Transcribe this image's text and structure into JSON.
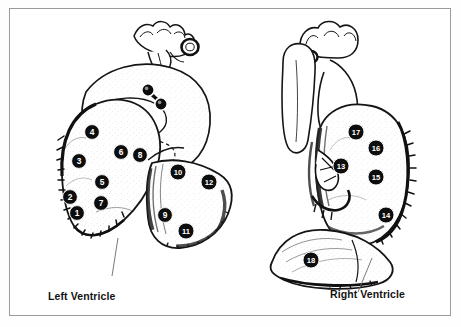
{
  "figure": {
    "border_color": "#9a9a9a",
    "background": "#ffffff",
    "ink_color": "#111111",
    "marker_fill": "#0d0d0d",
    "marker_text_color": "#ffffff"
  },
  "captions": {
    "left": "Left Ventricle",
    "right": "Right Ventricle"
  },
  "panels": [
    {
      "id": "left-ventricle",
      "caption": "Left Ventricle",
      "markers": [
        {
          "label": "1",
          "x": 77,
          "y": 213
        },
        {
          "label": "2",
          "x": 70,
          "y": 197
        },
        {
          "label": "3",
          "x": 79,
          "y": 161
        },
        {
          "label": "4",
          "x": 92,
          "y": 132
        },
        {
          "label": "5",
          "x": 102,
          "y": 182
        },
        {
          "label": "6",
          "x": 121,
          "y": 152
        },
        {
          "label": "7",
          "x": 101,
          "y": 203
        },
        {
          "label": "8",
          "x": 140,
          "y": 155
        },
        {
          "label": "9",
          "x": 165,
          "y": 215
        },
        {
          "label": "10",
          "x": 178,
          "y": 172
        },
        {
          "label": "11",
          "x": 186,
          "y": 231
        },
        {
          "label": "12",
          "x": 209,
          "y": 182
        }
      ],
      "ostia_markers": [
        {
          "name": "ostium-upper",
          "x": 148,
          "y": 90
        },
        {
          "name": "ostium-lower",
          "x": 161,
          "y": 104
        }
      ]
    },
    {
      "id": "right-ventricle",
      "caption": "Right Ventricle",
      "markers": [
        {
          "label": "13",
          "x": 341,
          "y": 166
        },
        {
          "label": "14",
          "x": 386,
          "y": 215
        },
        {
          "label": "15",
          "x": 376,
          "y": 177
        },
        {
          "label": "16",
          "x": 376,
          "y": 148
        },
        {
          "label": "17",
          "x": 356,
          "y": 132
        },
        {
          "label": "18",
          "x": 311,
          "y": 260
        }
      ]
    }
  ]
}
